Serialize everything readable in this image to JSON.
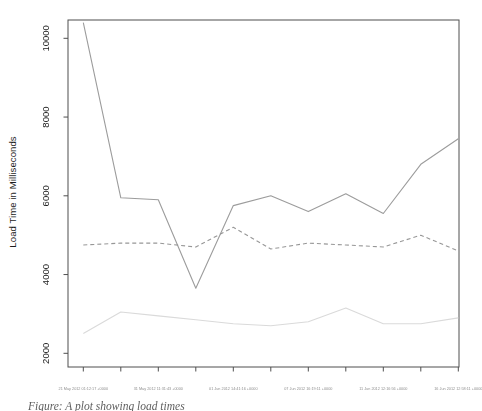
{
  "chart_data": {
    "type": "line",
    "title": "",
    "xlabel": "",
    "ylabel": "Load Time in Milliseconds",
    "y_ticks": [
      2000,
      4000,
      6000,
      8000,
      10000
    ],
    "ylim": [
      1900,
      10450
    ],
    "grid": false,
    "legend": "none",
    "x_tick_count": 11,
    "x_label_tick_indexes": [
      0,
      2,
      4,
      6,
      8,
      10
    ],
    "x_labels": [
      "21 May 2012 01:12:17 +0000",
      "31 May 2012 11:31:43 +0000",
      "01 Jun 2012 14:41:16 +0000",
      "07 Jun 2012 16:19:11 +0000",
      "11 Jun 2012 12:16:56 +0000",
      "16 Jun 2012 12:58:11 +0000"
    ],
    "series": [
      {
        "name": "line-solid-gray",
        "style": "solid",
        "color": "#9c9c9c",
        "values": [
          10400,
          5950,
          5900,
          3650,
          5750,
          6000,
          5600,
          6050,
          5550,
          6800,
          7450
        ]
      },
      {
        "name": "line-dashed-gray",
        "style": "dashed",
        "color": "#979797",
        "values": [
          4750,
          4800,
          4800,
          4700,
          5200,
          4650,
          4800,
          4750,
          4700,
          5000,
          4600
        ]
      },
      {
        "name": "line-light-gray",
        "style": "solid",
        "color": "#dadada",
        "values": [
          2500,
          3050,
          2950,
          2850,
          2750,
          2700,
          2800,
          3150,
          2750,
          2750,
          2900
        ]
      }
    ],
    "axis_color": "#4f4f4f",
    "tick_label_color": "#1a1a1a",
    "x_label_color": "#8f8f8f",
    "caption": "Figure: A plot showing load times"
  }
}
